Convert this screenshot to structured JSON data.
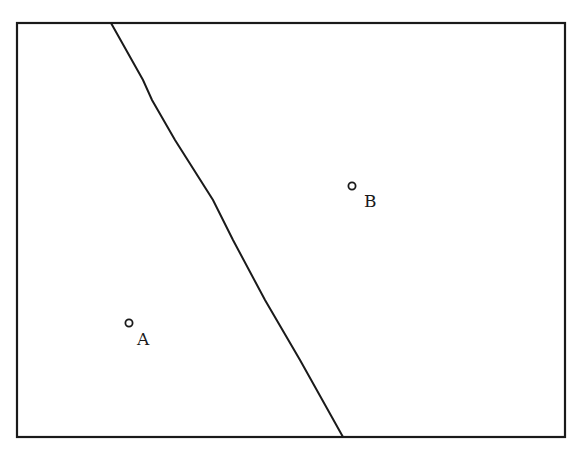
{
  "diagram": {
    "frame": {
      "x": 17,
      "y": 23,
      "width": 548,
      "height": 414,
      "stroke": "#1a1a1a"
    },
    "divider": {
      "points": [
        [
          111,
          23
        ],
        [
          143,
          80
        ],
        [
          152,
          100
        ],
        [
          175,
          140
        ],
        [
          213,
          200
        ],
        [
          233,
          240
        ],
        [
          265,
          300
        ],
        [
          300,
          360
        ],
        [
          343,
          437
        ]
      ],
      "stroke": "#1a1a1a"
    },
    "points": [
      {
        "id": "A",
        "label": "A",
        "cx": 129,
        "cy": 323,
        "label_x": 137,
        "label_y": 345
      },
      {
        "id": "B",
        "label": "B",
        "cx": 352,
        "cy": 186,
        "label_x": 364,
        "label_y": 207
      }
    ]
  }
}
